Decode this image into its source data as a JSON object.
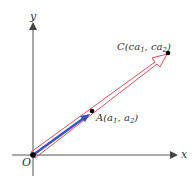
{
  "diagram": {
    "axes": {
      "x_label": "x",
      "y_label": "y",
      "origin_label": "O"
    },
    "points": {
      "A": {
        "name": "A",
        "label_main": "A(a",
        "sub1": "1",
        "mid": ", a",
        "sub2": "2",
        "end": ")"
      },
      "C": {
        "name": "C",
        "label_main": "C(ca",
        "sub1": "1",
        "mid": ", ca",
        "sub2": "2",
        "end": ")"
      }
    },
    "vectors": [
      {
        "name": "vector-a",
        "from": "O",
        "to": "A",
        "style": "solid",
        "color": "#3b4fc4"
      },
      {
        "name": "vector-ca",
        "from": "O",
        "to": "C",
        "style": "outlined",
        "color": "#e0505a"
      }
    ],
    "colors": {
      "axis": "#444444",
      "blue_vector": "#3b4fc4",
      "red_vector_outline": "#e0505a",
      "point": "#000000"
    }
  }
}
